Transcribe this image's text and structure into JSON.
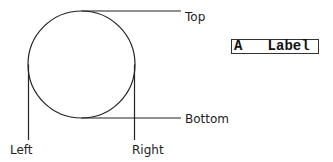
{
  "diagram": {
    "circle": {
      "cx": 81.5,
      "cy": 64.5,
      "r": 53.5,
      "stroke": "#222222"
    },
    "lines": [
      {
        "name": "top-line",
        "x1": 81.5,
        "y1": 11,
        "x2": 181,
        "y2": 11
      },
      {
        "name": "bottom-line",
        "x1": 81.5,
        "y1": 118,
        "x2": 181,
        "y2": 118
      },
      {
        "name": "left-line",
        "x1": 28.5,
        "y1": 64.5,
        "x2": 28.5,
        "y2": 140
      },
      {
        "name": "right-line",
        "x1": 134.5,
        "y1": 64.5,
        "x2": 134.5,
        "y2": 140
      }
    ],
    "labels": {
      "top": "Top",
      "bottom": "Bottom",
      "left": "Left",
      "right": "Right"
    },
    "boxed_label": "A   Label"
  }
}
